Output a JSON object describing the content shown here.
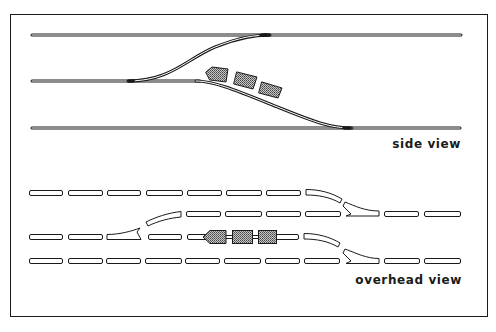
{
  "labels": {
    "side_view": "side view",
    "overhead_view": "overhead view"
  },
  "colors": {
    "ink": "#1a1a1a",
    "rail_gap": "#ffffff",
    "car_fill": "#9a9a9a",
    "background": "#ffffff"
  },
  "side_view": {
    "rails": [
      {
        "name": "upper-track",
        "y": 35,
        "x1": 32,
        "x2": 461
      },
      {
        "name": "middle-track",
        "y": 81,
        "x1": 32,
        "x2": 200
      },
      {
        "name": "lower-track",
        "y": 128,
        "x1": 32,
        "x2": 460
      }
    ],
    "cars": 3
  },
  "overhead_view": {
    "rows": [
      {
        "name": "row-1",
        "y": 193
      },
      {
        "name": "row-2",
        "y": 214
      },
      {
        "name": "row-3",
        "y": 237
      },
      {
        "name": "row-4",
        "y": 261
      }
    ],
    "cars": 3
  }
}
